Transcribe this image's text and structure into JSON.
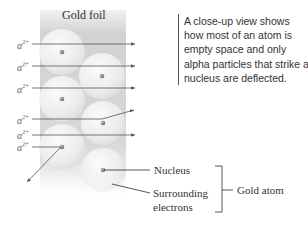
{
  "diagram": {
    "title": "Gold foil",
    "caption": "A close-up view shows how most of an atom is empty space and only alpha particles that strike a nucleus are deflected.",
    "particle_label": "α",
    "particle_charge": "2+",
    "particles": [
      {
        "id": 1,
        "path": "straight",
        "y": 44
      },
      {
        "id": 2,
        "path": "straight",
        "y": 66
      },
      {
        "id": 3,
        "path": "straight",
        "y": 88
      },
      {
        "id": 4,
        "path": "deflected-up",
        "y": 119
      },
      {
        "id": 5,
        "path": "straight",
        "y": 135
      },
      {
        "id": 6,
        "path": "deflected-down-left",
        "y": 147
      }
    ],
    "labels": {
      "nucleus": "Nucleus",
      "surrounding_line1": "Surrounding",
      "surrounding_line2": "electrons",
      "gold_atom": "Gold atom"
    },
    "colors": {
      "arrow": "#555555",
      "atom_fill": "#e8e8e8",
      "foil_bg": "#d0d0d0",
      "nucleus": "#777777",
      "text": "#333333"
    }
  }
}
